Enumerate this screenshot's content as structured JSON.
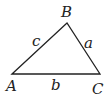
{
  "diagram": {
    "type": "triangle",
    "vertices": [
      {
        "label": "A",
        "x": 12,
        "y": 74
      },
      {
        "label": "B",
        "x": 67,
        "y": 23
      },
      {
        "label": "C",
        "x": 100,
        "y": 74
      }
    ],
    "sides": [
      {
        "label": "a",
        "between": "B-C"
      },
      {
        "label": "b",
        "between": "A-C"
      },
      {
        "label": "c",
        "between": "A-B"
      }
    ],
    "stroke_color": "#222222",
    "background": "#ffffff"
  }
}
